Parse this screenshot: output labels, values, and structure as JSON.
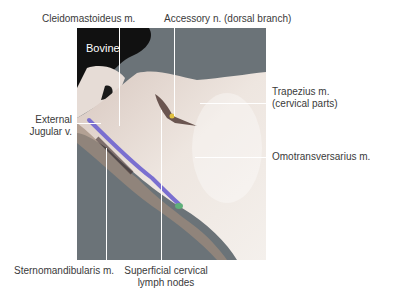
{
  "figure": {
    "species_label": "Bovine",
    "labels": {
      "cleidomastoideus": "Cleidomastoideus m.",
      "accessory": "Accessory n. (dorsal branch)",
      "external_jugular_line1": "External",
      "external_jugular_line2": "Jugular v.",
      "trapezius_line1": "Trapezius m.",
      "trapezius_line2": "(cervical parts)",
      "omotransversarius": "Omotransversarius m.",
      "sternomandibularis": "Sternomandibularis m.",
      "superficial_cervical_line1": "Superficial cervical",
      "superficial_cervical_line2": "lymph nodes"
    },
    "colors": {
      "background": "#ffffff",
      "photo_backdrop": "#6b7378",
      "tissue": "#e8e0da",
      "jugular_vein": "#7a6fd0",
      "lymph_node": "#5fb07a",
      "nerve": "#e0c040",
      "leader_lines": "#ffffff"
    }
  }
}
